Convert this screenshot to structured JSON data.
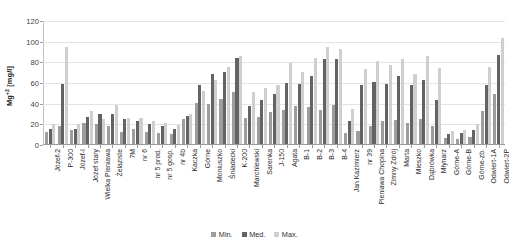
{
  "chart_data": {
    "type": "bar",
    "title": "",
    "subtitle": "",
    "xlabel": "",
    "ylabel": "Mg+2 [mg/l]",
    "ylim": [
      0,
      120
    ],
    "ytick_step": 20,
    "yticks": [
      0,
      20,
      40,
      60,
      80,
      100,
      120
    ],
    "grid": true,
    "legend_position": "bottom",
    "legend": [
      "Min.",
      "Med.",
      "Max."
    ],
    "series_colors": {
      "Min.": "#9d9d9d",
      "Med.": "#636363",
      "Max.": "#cfcfcf"
    },
    "categories": [
      "Józef-2",
      "P-300",
      "Józef-I",
      "Józef stary",
      "Wielka Pieniawa",
      "Żelaziste",
      "7M",
      "nr 6",
      "nr 5 prod.",
      "nr 5 gosp.",
      "nr 4b",
      "Kaczka",
      "Górne",
      "Moniuszko",
      "Śniadecki",
      "K-200",
      "Marchlewski",
      "Sarenka",
      "J-150",
      "Agata",
      "B-1",
      "B-2",
      "B-3",
      "B-4",
      "Jan Kazimierz",
      "nr 39",
      "Pieniawa Chopina",
      "Zimny Zdrój",
      "Marta",
      "Mieszko",
      "Dąbrówka",
      "Młynarz",
      "Górne-A",
      "Górne-B",
      "Górne-zb.",
      "Odwiert-1A",
      "Odwiert-2P"
    ],
    "series": [
      {
        "name": "Min.",
        "values": [
          12,
          17,
          14,
          20,
          19,
          17,
          12,
          15,
          12,
          11,
          10,
          24,
          40,
          39,
          44,
          50,
          25,
          26,
          31,
          33,
          37,
          36,
          33,
          38,
          11,
          13,
          17,
          22,
          23,
          20,
          24,
          17,
          6,
          5,
          7,
          32,
          48
        ]
      },
      {
        "name": "Med.",
        "values": [
          15,
          58,
          15,
          26,
          29,
          29,
          24,
          22,
          19,
          17,
          15,
          27,
          57,
          68,
          70,
          83,
          37,
          43,
          48,
          59,
          58,
          66,
          82,
          82,
          22,
          57,
          60,
          58,
          66,
          57,
          62,
          43,
          10,
          11,
          14,
          57,
          86
        ]
      },
      {
        "name": "Max.",
        "values": [
          19,
          94,
          19,
          32,
          24,
          38,
          25,
          25,
          22,
          20,
          18,
          29,
          51,
          62,
          75,
          85,
          50,
          54,
          57,
          78,
          70,
          83,
          94,
          92,
          34,
          73,
          80,
          76,
          82,
          68,
          85,
          74,
          13,
          14,
          19,
          75,
          103
        ]
      }
    ]
  },
  "legend": {
    "items": [
      {
        "label": "Min.",
        "key": "min"
      },
      {
        "label": "Med.",
        "key": "med"
      },
      {
        "label": "Max.",
        "key": "max"
      }
    ]
  },
  "axis": {
    "y_title_main": "Mg",
    "y_title_sup": "+2",
    "y_title_unit": " [mg/l]"
  }
}
